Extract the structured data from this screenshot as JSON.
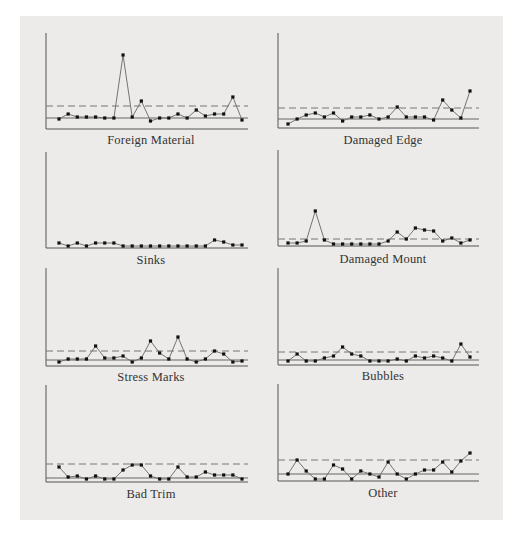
{
  "figure": {
    "background": "#ecebea",
    "axis_color": "#555555",
    "line_color": "#666666",
    "marker_color": "#111111"
  },
  "chart_data": [
    {
      "type": "line",
      "title": "Foreign Material",
      "xlabel": "",
      "ylabel": "",
      "grid": false,
      "x": [
        1,
        2,
        3,
        4,
        5,
        6,
        7,
        8,
        9,
        10,
        11,
        12,
        13,
        14,
        15,
        16,
        17,
        18,
        19,
        20,
        21,
        22
      ],
      "values": [
        8,
        13,
        10,
        10,
        10,
        9,
        9,
        72,
        10,
        26,
        6,
        9,
        9,
        13,
        9,
        17,
        11,
        13,
        13,
        30,
        7
      ],
      "values_note": "relative units (pixels above baseline); no tick labels shown",
      "full_values": [
        8,
        13,
        10,
        10,
        10,
        9,
        9,
        72,
        10,
        26,
        6,
        9,
        9,
        13,
        9,
        17,
        11,
        13,
        13,
        30,
        7
      ],
      "mean_line": 11,
      "upper_control_limit": 23,
      "ylim": [
        0,
        96
      ]
    },
    {
      "type": "line",
      "title": "Damaged Edge",
      "xlabel": "",
      "ylabel": "",
      "grid": false,
      "x": [
        1,
        2,
        3,
        4,
        5,
        6,
        7,
        8,
        9,
        10,
        11,
        12,
        13,
        14,
        15,
        16,
        17,
        18,
        19,
        20,
        21,
        22
      ],
      "values": [
        2,
        7,
        11,
        13,
        9,
        13,
        5,
        9,
        9,
        11,
        7,
        9,
        19,
        9,
        9,
        9,
        6,
        26,
        16,
        8,
        35
      ],
      "values_note": "relative units (pixels above baseline)",
      "mean_line": 9,
      "upper_control_limit": 20,
      "ylim": [
        0,
        95
      ]
    },
    {
      "type": "line",
      "title": "Sinks",
      "xlabel": "",
      "ylabel": "",
      "grid": false,
      "x": [
        1,
        2,
        3,
        4,
        5,
        6,
        7,
        8,
        9,
        10,
        11,
        12,
        13,
        14,
        15,
        16,
        17,
        18,
        19,
        20,
        21
      ],
      "values": [
        3,
        0,
        3,
        0,
        3,
        3,
        3,
        0,
        0,
        0,
        0,
        0,
        0,
        0,
        0,
        0,
        0,
        6,
        4,
        1,
        1
      ],
      "values_note": "relative units (pixels above baseline); no control lines shown",
      "ylim": [
        0,
        96
      ]
    },
    {
      "type": "line",
      "title": "Damaged Mount",
      "xlabel": "",
      "ylabel": "",
      "grid": false,
      "x": [
        1,
        2,
        3,
        4,
        5,
        6,
        7,
        8,
        9,
        10,
        11,
        12,
        13,
        14,
        15,
        16,
        17,
        18,
        19,
        20,
        21
      ],
      "values": [
        1,
        1,
        3,
        33,
        4,
        0,
        0,
        0,
        0,
        0,
        0,
        3,
        12,
        5,
        16,
        14,
        13,
        3,
        6,
        1,
        4
      ],
      "values_note": "relative units (pixels above baseline)",
      "upper_control_limit": 7,
      "ylim": [
        0,
        96
      ]
    },
    {
      "type": "line",
      "title": "Stress Marks",
      "xlabel": "",
      "ylabel": "",
      "grid": false,
      "x": [
        1,
        2,
        3,
        4,
        5,
        6,
        7,
        8,
        9,
        10,
        11,
        12,
        13,
        14,
        15,
        16,
        17,
        18,
        19,
        20,
        21,
        22
      ],
      "values": [
        2,
        5,
        5,
        5,
        18,
        6,
        6,
        8,
        2,
        6,
        23,
        11,
        5,
        27,
        5,
        2,
        5,
        13,
        10,
        2,
        3
      ],
      "values_note": "relative units (pixels above baseline)",
      "mean_line": 6,
      "upper_control_limit": 15,
      "ylim": [
        0,
        98
      ]
    },
    {
      "type": "line",
      "title": "Bubbles",
      "xlabel": "",
      "ylabel": "",
      "grid": false,
      "x": [
        1,
        2,
        3,
        4,
        5,
        6,
        7,
        8,
        9,
        10,
        11,
        12,
        13,
        14,
        15,
        16,
        17,
        18,
        19,
        20,
        21,
        22
      ],
      "values": [
        2,
        9,
        2,
        2,
        5,
        7,
        16,
        9,
        7,
        2,
        2,
        2,
        4,
        2,
        7,
        5,
        7,
        5,
        2,
        19,
        6
      ],
      "values_note": "relative units (pixels above baseline)",
      "mean_line": 5,
      "upper_control_limit": 13,
      "ylim": [
        0,
        97
      ]
    },
    {
      "type": "line",
      "title": "Bad Trim",
      "xlabel": "",
      "ylabel": "",
      "grid": false,
      "x": [
        1,
        2,
        3,
        4,
        5,
        6,
        7,
        8,
        9,
        10,
        11,
        12,
        13,
        14,
        15,
        16,
        17,
        18,
        19,
        20,
        21,
        22
      ],
      "values": [
        13,
        3,
        4,
        1,
        4,
        1,
        1,
        10,
        15,
        15,
        4,
        1,
        1,
        13,
        3,
        3,
        8,
        5,
        5,
        5,
        1
      ],
      "values_note": "relative units (pixels above baseline)",
      "mean_line": 4,
      "upper_control_limit": 18,
      "ylim": [
        0,
        97
      ]
    },
    {
      "type": "line",
      "title": "Other",
      "xlabel": "",
      "ylabel": "",
      "grid": false,
      "x": [
        1,
        2,
        3,
        4,
        5,
        6,
        7,
        8,
        9,
        10,
        11,
        12,
        13,
        14,
        15,
        16,
        17,
        18,
        19,
        20,
        21,
        22
      ],
      "values": [
        5,
        19,
        8,
        0,
        0,
        14,
        10,
        0,
        8,
        5,
        2,
        17,
        5,
        0,
        5,
        9,
        9,
        17,
        7,
        18,
        26
      ],
      "values_note": "relative units (pixels above baseline)",
      "mean_line": 7,
      "upper_control_limit": 21,
      "ylim": [
        0,
        97
      ]
    }
  ],
  "labels": {
    "foreign_material": "Foreign Material",
    "damaged_edge": "Damaged Edge",
    "sinks": "Sinks",
    "damaged_mount": "Damaged Mount",
    "stress_marks": "Stress Marks",
    "bubbles": "Bubbles",
    "bad_trim": "Bad Trim",
    "other": "Other"
  }
}
